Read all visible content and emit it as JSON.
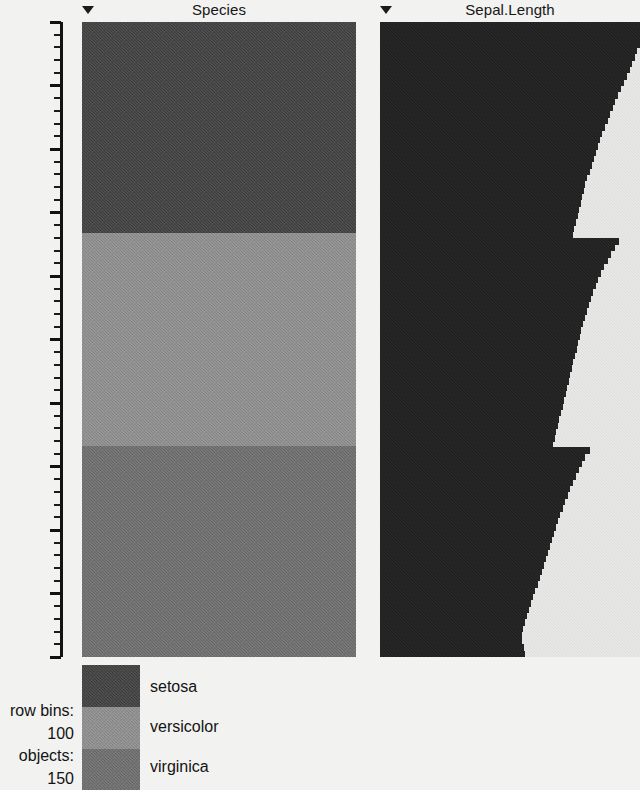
{
  "columns": [
    {
      "name": "Species",
      "title": "Species",
      "sort_indicator": "triangle-down-icon",
      "x": 82,
      "width": 274,
      "type": "categorical"
    },
    {
      "name": "Sepal.Length",
      "title": "Sepal.Length",
      "sort_indicator": "triangle-down-icon",
      "x": 380,
      "width": 260,
      "type": "numeric"
    }
  ],
  "axis": {
    "name": "row-percent-axis",
    "labels": [
      "0%",
      "10%",
      "20%",
      "30%",
      "40%",
      "50%",
      "60%",
      "70%",
      "80%",
      "90%",
      "100%"
    ],
    "major_step_percent": 10,
    "minor_step_percent": 2,
    "range": [
      0,
      100
    ]
  },
  "legend": {
    "name": "species-legend",
    "entries": [
      {
        "label": "setosa",
        "color": "#3d3d3d",
        "percent_span": [
          0,
          33.3
        ]
      },
      {
        "label": "versicolor",
        "color": "#8c8c8c",
        "percent_span": [
          33.3,
          66.7
        ]
      },
      {
        "label": "virginica",
        "color": "#6b6b6b",
        "percent_span": [
          66.7,
          100
        ]
      }
    ]
  },
  "stats": {
    "row_bins_label": "row bins:",
    "row_bins_value": "100",
    "objects_label": "objects:",
    "objects_value": "150"
  },
  "chart_data": {
    "type": "bar",
    "xlabel": "",
    "ylabel": "row percentile",
    "ylim": [
      0,
      100
    ],
    "grid": false,
    "legend_position": "bottom-left",
    "row_bins": 100,
    "objects": 150,
    "series": [
      {
        "name": "Species",
        "type": "categorical-band",
        "bands": [
          {
            "value": "setosa",
            "from_percent": 0,
            "to_percent": 33.3,
            "color": "#3d3d3d"
          },
          {
            "value": "versicolor",
            "from_percent": 33.3,
            "to_percent": 66.7,
            "color": "#8c8c8c"
          },
          {
            "value": "virginica",
            "from_percent": 66.7,
            "to_percent": 100,
            "color": "#6b6b6b"
          }
        ]
      },
      {
        "name": "Sepal.Length",
        "type": "bar",
        "bar_color": "#1c1c1c",
        "sorted": "descending",
        "bin_percent": [
          0,
          1,
          2,
          3,
          4,
          5,
          6,
          7,
          8,
          9,
          10,
          11,
          12,
          13,
          14,
          15,
          16,
          17,
          18,
          19,
          20,
          21,
          22,
          23,
          24,
          25,
          26,
          27,
          28,
          29,
          30,
          31,
          32,
          33,
          34,
          35,
          36,
          37,
          38,
          39,
          40,
          41,
          42,
          43,
          44,
          45,
          46,
          47,
          48,
          49,
          50,
          51,
          52,
          53,
          54,
          55,
          56,
          57,
          58,
          59,
          60,
          61,
          62,
          63,
          64,
          65,
          66,
          67,
          68,
          69,
          70,
          71,
          72,
          73,
          74,
          75,
          76,
          77,
          78,
          79,
          80,
          81,
          82,
          83,
          84,
          85,
          86,
          87,
          88,
          89,
          90,
          91,
          92,
          93,
          94,
          95,
          96,
          97,
          98,
          99
        ],
        "bar_length_fraction": [
          1.0,
          1.0,
          1.0,
          1.0,
          0.99,
          0.98,
          0.97,
          0.96,
          0.95,
          0.94,
          0.925,
          0.915,
          0.905,
          0.895,
          0.885,
          0.875,
          0.865,
          0.855,
          0.845,
          0.838,
          0.83,
          0.822,
          0.814,
          0.806,
          0.798,
          0.79,
          0.784,
          0.778,
          0.772,
          0.766,
          0.76,
          0.754,
          0.748,
          0.742,
          0.92,
          0.905,
          0.89,
          0.875,
          0.862,
          0.85,
          0.84,
          0.83,
          0.82,
          0.812,
          0.804,
          0.796,
          0.788,
          0.78,
          0.774,
          0.768,
          0.762,
          0.756,
          0.75,
          0.744,
          0.738,
          0.732,
          0.726,
          0.72,
          0.714,
          0.708,
          0.702,
          0.696,
          0.69,
          0.684,
          0.678,
          0.672,
          0.666,
          0.806,
          0.79,
          0.776,
          0.764,
          0.752,
          0.742,
          0.732,
          0.722,
          0.712,
          0.702,
          0.694,
          0.686,
          0.678,
          0.67,
          0.662,
          0.654,
          0.646,
          0.638,
          0.63,
          0.622,
          0.614,
          0.606,
          0.598,
          0.59,
          0.582,
          0.574,
          0.566,
          0.558,
          0.55,
          0.546,
          0.548,
          0.552,
          0.556
        ]
      }
    ]
  }
}
